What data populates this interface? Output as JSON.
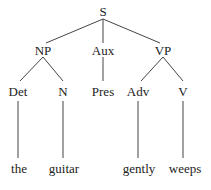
{
  "tree": {
    "root": "S",
    "level1": [
      "NP",
      "Aux",
      "VP"
    ],
    "level2": [
      "Det",
      "N",
      "Pres",
      "Adv",
      "V"
    ],
    "leaves": [
      "the",
      "guitar",
      "gently",
      "weeps"
    ]
  },
  "nodes": {
    "S": "S",
    "NP": "NP",
    "Aux": "Aux",
    "VP": "VP",
    "Det": "Det",
    "N": "N",
    "Pres": "Pres",
    "Adv": "Adv",
    "V": "V",
    "the": "the",
    "guitar": "guitar",
    "gently": "gently",
    "weeps": "weeps"
  },
  "colors": {
    "line": "#333333",
    "text": "#222222"
  }
}
